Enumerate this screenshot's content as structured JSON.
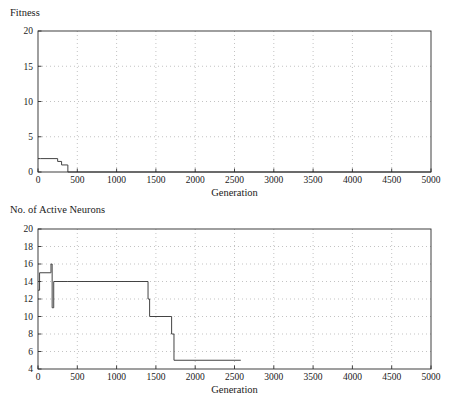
{
  "figure": {
    "background_color": "#ffffff",
    "line_color": "#3a3a3a",
    "grid_color": "#9a9a9a",
    "axis_color": "#2b2b2b"
  },
  "panels": {
    "fitness": {
      "corner_label": "Fitness",
      "xlabel": "Generation"
    },
    "neurons": {
      "corner_label": "No. of Active Neurons",
      "xlabel": "Generation"
    }
  },
  "chart_data": [
    {
      "type": "line",
      "title": "Fitness",
      "xlabel": "Generation",
      "ylabel": "Fitness",
      "xlim": [
        0,
        5000
      ],
      "ylim": [
        0,
        20
      ],
      "xticks": [
        0,
        500,
        1000,
        1500,
        2000,
        2500,
        3000,
        3500,
        4000,
        4500,
        5000
      ],
      "yticks": [
        0,
        5,
        10,
        15,
        20
      ],
      "xtick_labels": [
        "0",
        "500",
        "1000",
        "1500",
        "2000",
        "2500",
        "3000",
        "3500",
        "4000",
        "4500",
        "5000"
      ],
      "ytick_labels": [
        "0",
        "5",
        "10",
        "15",
        "20"
      ],
      "grid": true,
      "grid_style": "dotted",
      "legend": false,
      "series": [
        {
          "name": "Best fitness",
          "step": "post",
          "x": [
            0,
            30,
            250,
            300,
            375,
            380,
            5000
          ],
          "y": [
            1.9,
            1.9,
            1.5,
            1.0,
            1.0,
            0.0,
            0.0
          ]
        }
      ]
    },
    {
      "type": "line",
      "title": "No. of Active Neurons",
      "xlabel": "Generation",
      "ylabel": "No. of Active Neurons",
      "xlim": [
        0,
        5000
      ],
      "ylim": [
        4,
        20
      ],
      "xticks": [
        0,
        500,
        1000,
        1500,
        2000,
        2500,
        3000,
        3500,
        4000,
        4500,
        5000
      ],
      "yticks": [
        4,
        6,
        8,
        10,
        12,
        14,
        16,
        18,
        20
      ],
      "xtick_labels": [
        "0",
        "500",
        "1000",
        "1500",
        "2000",
        "2500",
        "3000",
        "3500",
        "4000",
        "4500",
        "5000"
      ],
      "ytick_labels": [
        "4",
        "6",
        "8",
        "10",
        "12",
        "14",
        "16",
        "18",
        "20"
      ],
      "grid": true,
      "grid_style": "dotted",
      "legend": false,
      "series": [
        {
          "name": "Active neurons",
          "step": "post",
          "x": [
            0,
            10,
            20,
            160,
            165,
            175,
            180,
            190,
            200,
            380,
            1400,
            1420,
            1680,
            1700,
            1730,
            2580
          ],
          "y": [
            13,
            13,
            15,
            15,
            16,
            16,
            11,
            11,
            14,
            14,
            12,
            10,
            10,
            8,
            5,
            5
          ]
        }
      ]
    }
  ]
}
